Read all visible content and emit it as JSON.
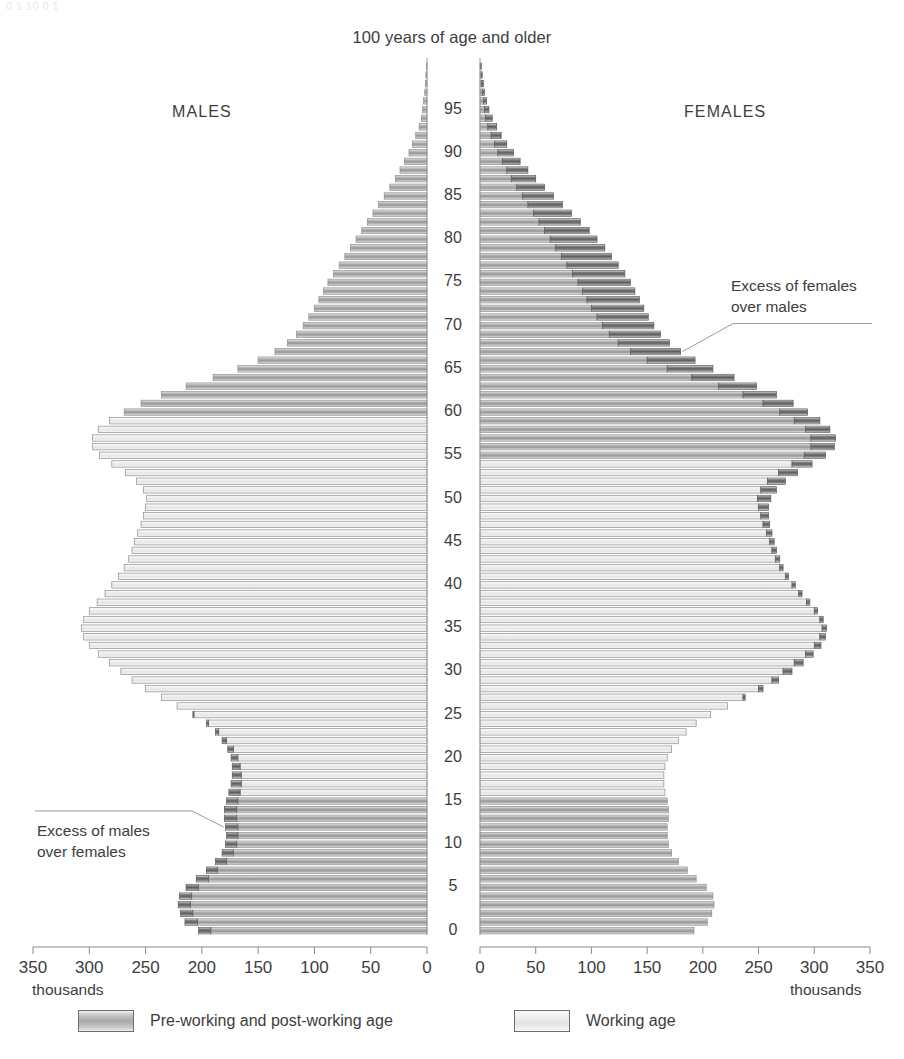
{
  "page": {
    "top_cutoff_text": "0                     1                    10                    0                    1",
    "title": "100 years of age and older",
    "males_label": "MALES",
    "females_label": "FEMALES"
  },
  "axes": {
    "age": {
      "label_unit": "years",
      "min": 0,
      "max": 100,
      "tick_step": 5,
      "ticks": [
        0,
        5,
        10,
        15,
        20,
        25,
        30,
        35,
        40,
        45,
        50,
        55,
        60,
        65,
        70,
        75,
        80,
        85,
        90,
        95
      ]
    },
    "left": {
      "unit": "thousands",
      "unit_label": "thousands",
      "ticks": [
        350,
        300,
        250,
        200,
        150,
        100,
        50,
        0
      ],
      "max": 350,
      "direction": "right-to-left"
    },
    "right": {
      "unit": "thousands",
      "unit_label": "thousands",
      "ticks": [
        0,
        50,
        100,
        150,
        200,
        250,
        300,
        350
      ],
      "max": 350,
      "direction": "left-to-right"
    }
  },
  "annotations": [
    {
      "id": "excess-females",
      "line1": "Excess of females",
      "line2": "over males",
      "points_to_age": 67,
      "side": "right"
    },
    {
      "id": "excess-males",
      "line1": "Excess of males",
      "line2": "over females",
      "points_to_age": 12,
      "side": "left"
    }
  ],
  "legend": {
    "position": "bottom",
    "items": [
      {
        "label": "Pre-working and post-working age",
        "swatch": "dark-gradient"
      },
      {
        "label": "Working age",
        "swatch": "light-gradient"
      }
    ]
  },
  "colors": {
    "pre_post_working": "#a8a8a8",
    "working": "#e8e8e8",
    "excess_overhang": "#6d6d6d",
    "axis": "#8a8a8a",
    "text": "#3d3d3d",
    "background": "#ffffff"
  },
  "chart_data": {
    "type": "bar",
    "subtype": "population-pyramid",
    "title": "100 years of age and older",
    "xlabel": "thousands",
    "ylabel": "Age (years)",
    "xlim": [
      0,
      350
    ],
    "ylim": [
      0,
      100
    ],
    "grid": false,
    "legend_position": "bottom",
    "categories_note": "single-year age groups, 0 to 100+",
    "working_age": {
      "males": [
        16,
        59
      ],
      "females": [
        16,
        54
      ]
    },
    "x": [
      0,
      1,
      2,
      3,
      4,
      5,
      6,
      7,
      8,
      9,
      10,
      11,
      12,
      13,
      14,
      15,
      16,
      17,
      18,
      19,
      20,
      21,
      22,
      23,
      24,
      25,
      26,
      27,
      28,
      29,
      30,
      31,
      32,
      33,
      34,
      35,
      36,
      37,
      38,
      39,
      40,
      41,
      42,
      43,
      44,
      45,
      46,
      47,
      48,
      49,
      50,
      51,
      52,
      53,
      54,
      55,
      56,
      57,
      58,
      59,
      60,
      61,
      62,
      63,
      64,
      65,
      66,
      67,
      68,
      69,
      70,
      71,
      72,
      73,
      74,
      75,
      76,
      77,
      78,
      79,
      80,
      81,
      82,
      83,
      84,
      85,
      86,
      87,
      88,
      89,
      90,
      91,
      92,
      93,
      94,
      95,
      96,
      97,
      98,
      99,
      100
    ],
    "series": [
      {
        "name": "MALES",
        "side": "left",
        "values": [
          203,
          215,
          219,
          221,
          220,
          214,
          205,
          196,
          188,
          182,
          179,
          178,
          179,
          180,
          180,
          178,
          176,
          174,
          173,
          173,
          174,
          177,
          182,
          188,
          196,
          208,
          222,
          236,
          250,
          262,
          272,
          282,
          292,
          300,
          305,
          307,
          305,
          300,
          293,
          286,
          280,
          274,
          269,
          265,
          262,
          260,
          257,
          254,
          252,
          250,
          249,
          252,
          258,
          268,
          280,
          291,
          297,
          297,
          292,
          282,
          269,
          254,
          236,
          214,
          190,
          168,
          150,
          135,
          124,
          116,
          110,
          105,
          100,
          96,
          92,
          88,
          83,
          78,
          73,
          68,
          63,
          58,
          53,
          48,
          43,
          38,
          33,
          28,
          24,
          20,
          16,
          13,
          10,
          7,
          5,
          4,
          3,
          2,
          1.5,
          1,
          0.6
        ]
      },
      {
        "name": "FEMALES",
        "side": "right",
        "values": [
          192,
          204,
          208,
          210,
          209,
          203,
          194,
          186,
          178,
          172,
          169,
          168,
          168,
          169,
          169,
          168,
          166,
          165,
          165,
          166,
          168,
          172,
          178,
          185,
          194,
          207,
          222,
          238,
          254,
          268,
          280,
          290,
          299,
          306,
          310,
          311,
          308,
          303,
          296,
          289,
          283,
          277,
          272,
          269,
          266,
          264,
          262,
          260,
          259,
          259,
          261,
          266,
          274,
          285,
          298,
          310,
          318,
          319,
          314,
          305,
          294,
          281,
          266,
          248,
          228,
          209,
          193,
          180,
          170,
          162,
          156,
          151,
          147,
          143,
          139,
          135,
          130,
          124,
          118,
          112,
          105,
          98,
          90,
          82,
          74,
          66,
          58,
          50,
          43,
          36,
          30,
          24,
          19,
          15,
          11,
          8,
          6,
          4,
          3,
          2,
          1.2
        ]
      }
    ],
    "peaks": {
      "males_max": {
        "age": 31,
        "value": 345
      },
      "females_max": {
        "age": 31,
        "value": 337
      },
      "males_secondary": {
        "age": 56,
        "value": 297
      },
      "females_secondary": {
        "age": 56,
        "value": 318
      }
    }
  }
}
